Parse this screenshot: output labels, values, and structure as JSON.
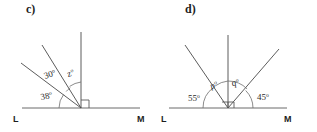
{
  "figure": {
    "background_color": "#ffffff",
    "line_color": "#4a4a4a",
    "text_color": "#1d1d1d"
  },
  "panels": [
    {
      "id": "c",
      "label": "c)",
      "baseline": {
        "left_label": "L",
        "right_label": "M"
      },
      "angles": [
        {
          "name": "angle-38",
          "value": "38",
          "degree": "o"
        },
        {
          "name": "angle-30",
          "value": "30",
          "degree": "o"
        },
        {
          "name": "angle-z",
          "value": "z",
          "degree": "o"
        }
      ],
      "right_angle_marker": true,
      "rays": [
        {
          "name": "ray-vertical",
          "angle_deg": 90
        },
        {
          "name": "ray-upper-oblique",
          "angle_deg": 58
        },
        {
          "name": "ray-lower-oblique",
          "angle_deg": 38
        }
      ]
    },
    {
      "id": "d",
      "label": "d)",
      "baseline": {
        "left_label": "L",
        "right_label": "M"
      },
      "angles": [
        {
          "name": "angle-55",
          "value": "55",
          "degree": "o"
        },
        {
          "name": "angle-p",
          "value": "p",
          "degree": "o"
        },
        {
          "name": "angle-q",
          "value": "q",
          "degree": "o"
        },
        {
          "name": "angle-45",
          "value": "45",
          "degree": "o"
        }
      ],
      "right_angle_marker": true,
      "rays": [
        {
          "name": "ray-vertical",
          "angle_deg": 90
        },
        {
          "name": "ray-left-oblique",
          "angle_deg": 125
        },
        {
          "name": "ray-right-oblique",
          "angle_deg": 45
        }
      ]
    }
  ]
}
